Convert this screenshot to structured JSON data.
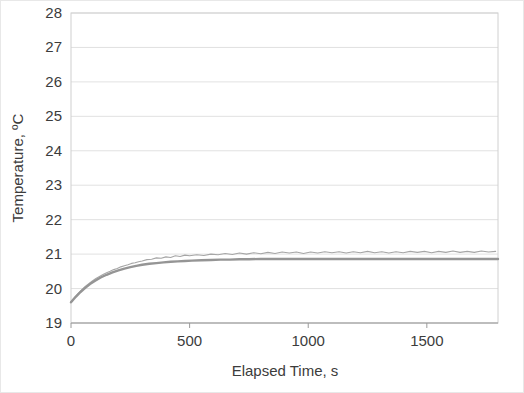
{
  "chart_data": {
    "type": "line",
    "title": "",
    "xlabel": "Elapsed Time, s",
    "ylabel": "Temperature, ºC",
    "xlim": [
      0,
      1800
    ],
    "ylim": [
      19,
      28
    ],
    "xticks": [
      0,
      500,
      1000,
      1500
    ],
    "xtick_labels": [
      "0",
      "500",
      "1000",
      "1500"
    ],
    "yticks": [
      19,
      20,
      21,
      22,
      23,
      24,
      25,
      26,
      27,
      28
    ],
    "ytick_labels": [
      "19",
      "20",
      "21",
      "22",
      "23",
      "24",
      "25",
      "26",
      "27",
      "28"
    ],
    "grid": {
      "horizontal": true,
      "vertical": false
    },
    "legend": {
      "visible": false,
      "position": "none"
    },
    "series": [
      {
        "name": "Measured temperature",
        "color": "#a6a6a6",
        "width": 1.1,
        "style": "noisy",
        "x": [
          0,
          15,
          30,
          45,
          60,
          75,
          90,
          105,
          120,
          135,
          150,
          165,
          180,
          195,
          210,
          225,
          240,
          255,
          270,
          285,
          300,
          320,
          340,
          360,
          380,
          400,
          420,
          440,
          460,
          480,
          500,
          530,
          560,
          590,
          620,
          650,
          680,
          710,
          740,
          770,
          800,
          830,
          860,
          890,
          920,
          950,
          980,
          1010,
          1040,
          1070,
          1100,
          1130,
          1160,
          1190,
          1220,
          1250,
          1280,
          1310,
          1340,
          1370,
          1400,
          1430,
          1460,
          1490,
          1520,
          1550,
          1580,
          1610,
          1640,
          1670,
          1700,
          1730,
          1760,
          1790
        ],
        "y": [
          19.62,
          19.74,
          19.86,
          19.96,
          20.06,
          20.14,
          20.22,
          20.29,
          20.35,
          20.41,
          20.46,
          20.5,
          20.55,
          20.58,
          20.63,
          20.66,
          20.69,
          20.73,
          20.75,
          20.78,
          20.8,
          20.84,
          20.85,
          20.89,
          20.88,
          20.92,
          20.9,
          20.95,
          20.93,
          20.97,
          20.95,
          20.98,
          20.96,
          21.0,
          20.98,
          21.02,
          20.99,
          21.03,
          21.0,
          21.04,
          21.01,
          21.05,
          21.02,
          21.06,
          21.03,
          21.06,
          21.02,
          21.06,
          21.03,
          21.07,
          21.04,
          21.07,
          21.03,
          21.07,
          21.04,
          21.08,
          21.04,
          21.07,
          21.03,
          21.07,
          21.04,
          21.08,
          21.05,
          21.08,
          21.04,
          21.08,
          21.05,
          21.09,
          21.05,
          21.08,
          21.05,
          21.09,
          21.06,
          21.08
        ]
      },
      {
        "name": "Fitted model",
        "color": "#959595",
        "width": 2.4,
        "style": "smooth",
        "x": [
          0,
          20,
          40,
          60,
          80,
          100,
          125,
          150,
          175,
          200,
          225,
          250,
          275,
          300,
          330,
          360,
          390,
          420,
          450,
          480,
          510,
          550,
          590,
          630,
          670,
          710,
          750,
          800,
          850,
          900,
          950,
          1000,
          1060,
          1120,
          1180,
          1250,
          1320,
          1400,
          1480,
          1560,
          1640,
          1720,
          1800
        ],
        "y": [
          19.6,
          19.76,
          19.9,
          20.02,
          20.13,
          20.22,
          20.32,
          20.4,
          20.47,
          20.53,
          20.58,
          20.62,
          20.66,
          20.69,
          20.72,
          20.74,
          20.76,
          20.78,
          20.79,
          20.8,
          20.81,
          20.82,
          20.83,
          20.84,
          20.84,
          20.85,
          20.85,
          20.86,
          20.86,
          20.86,
          20.86,
          20.86,
          20.86,
          20.86,
          20.86,
          20.86,
          20.86,
          20.86,
          20.86,
          20.86,
          20.86,
          20.86,
          20.86
        ]
      }
    ]
  },
  "layout": {
    "plot_left": 70,
    "plot_top": 12,
    "plot_right": 497,
    "plot_bottom": 322
  }
}
